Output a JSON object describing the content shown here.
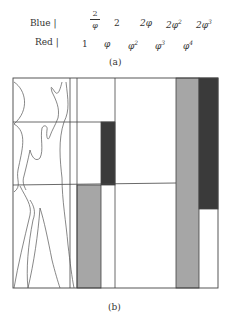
{
  "part_a": {
    "caption": "(a)",
    "rows": [
      {
        "label": "Blue |",
        "values": [
          "2/φ",
          "2",
          "2φ",
          "2φ²",
          "2φ³"
        ]
      },
      {
        "label": "Red |",
        "values": [
          "1",
          "φ",
          "φ²",
          "φ³",
          "φ⁴"
        ]
      }
    ],
    "blue_fraction": {
      "numerator": "2",
      "denominator": "φ"
    },
    "blue_rest": [
      "2",
      "2φ",
      "2φ",
      "2φ"
    ],
    "blue_sups": [
      "",
      "",
      "2",
      "3"
    ],
    "red_base": [
      "1",
      "φ",
      "φ",
      "φ",
      "φ"
    ],
    "red_sups": [
      "",
      "",
      "2",
      "3",
      "4"
    ]
  },
  "part_b": {
    "caption": "(b)",
    "colors": {
      "frame": "#444444",
      "gray": "#a6a6a6",
      "dark": "#3a3a3a",
      "background": "#ffffff"
    },
    "frame": {
      "x": 13,
      "y": 78,
      "w": 205,
      "h": 210
    },
    "rects": [
      {
        "name": "gray-bar-left",
        "x": 77,
        "y": 185,
        "w": 24,
        "h": 103,
        "fill": "gray"
      },
      {
        "name": "dark-bar-middle",
        "x": 101,
        "y": 122,
        "w": 14,
        "h": 63,
        "fill": "dark"
      },
      {
        "name": "gray-bar-right",
        "x": 176,
        "y": 78,
        "w": 23,
        "h": 210,
        "fill": "gray"
      },
      {
        "name": "dark-bar-right",
        "x": 199,
        "y": 78,
        "w": 19,
        "h": 131,
        "fill": "dark"
      }
    ]
  }
}
